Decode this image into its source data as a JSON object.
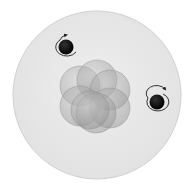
{
  "diagram": {
    "background_color": "#ffffff",
    "electron_cloud": {
      "cx": 97,
      "cy": 95,
      "r": 84,
      "fill": "#e9e9e9",
      "stroke": "#d4d4d4"
    },
    "nucleus": {
      "particle_fill": "#9c9c9c",
      "particle_opacity": 0.45,
      "particle_stroke": "#8a8a8a",
      "particles": [
        {
          "cx": 80,
          "cy": 86,
          "r": 20
        },
        {
          "cx": 97,
          "cy": 80,
          "r": 20
        },
        {
          "cx": 110,
          "cy": 90,
          "r": 20
        },
        {
          "cx": 80,
          "cy": 106,
          "r": 20
        },
        {
          "cx": 110,
          "cy": 108,
          "r": 20
        },
        {
          "cx": 96,
          "cy": 113,
          "r": 20
        },
        {
          "cx": 90,
          "cy": 110,
          "r": 19
        }
      ]
    },
    "electrons": [
      {
        "cx": 66,
        "cy": 47,
        "r": 7.5,
        "fill": "#111111",
        "spin": "counterclockwise"
      },
      {
        "cx": 157,
        "cy": 102,
        "r": 7.5,
        "fill": "#111111",
        "spin": "clockwise"
      }
    ]
  }
}
